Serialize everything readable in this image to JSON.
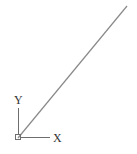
{
  "drawing": {
    "line": {
      "x1": 18,
      "y1": 138,
      "x2": 127,
      "y2": 6,
      "color": "#8a8a8a"
    },
    "ucs_icon": {
      "origin": {
        "x": 18,
        "y": 138
      },
      "x_label": "X",
      "y_label": "Y",
      "color": "#6e6e6e"
    }
  }
}
